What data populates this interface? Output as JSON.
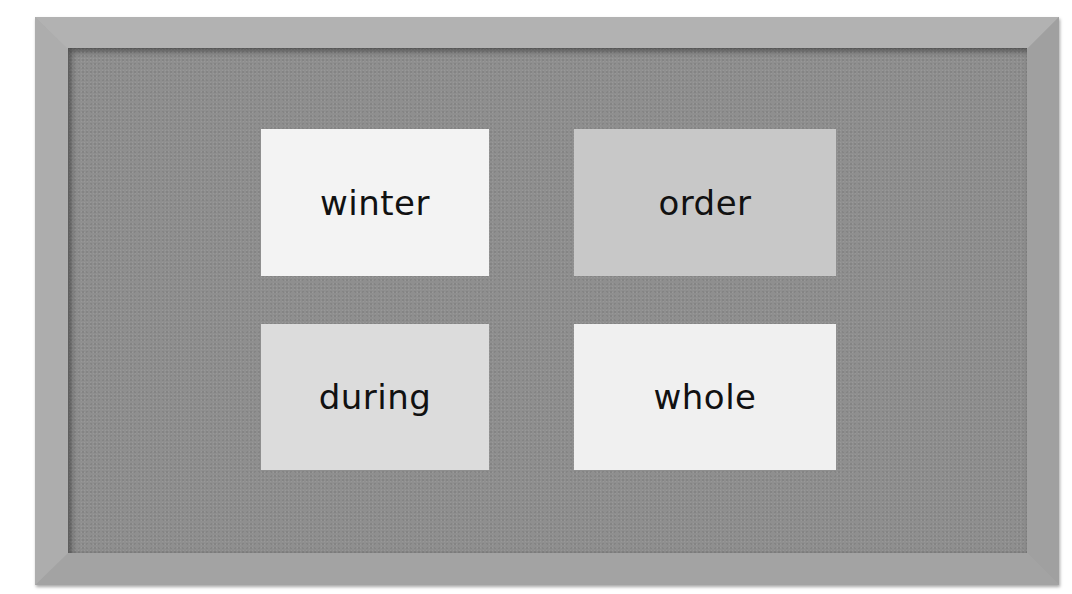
{
  "board": {
    "cards": [
      {
        "word": "winter",
        "color": "#f3f3f3"
      },
      {
        "word": "order",
        "color": "#c8c8c8"
      },
      {
        "word": "during",
        "color": "#dcdcdc"
      },
      {
        "word": "whole",
        "color": "#f0f0f0"
      }
    ]
  }
}
